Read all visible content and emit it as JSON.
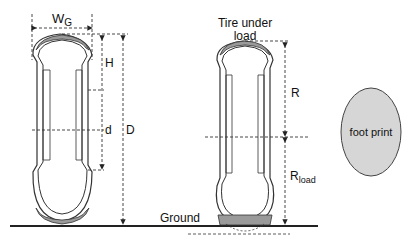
{
  "diagram": {
    "title": "",
    "left_tire": {
      "labels": {
        "width": "W",
        "width_sub": "G",
        "height": "H",
        "rim_diameter": "d",
        "overall_diameter": "D"
      }
    },
    "right_tire": {
      "caption_line1": "Tire under",
      "caption_line2": "load",
      "labels": {
        "radius": "R",
        "loaded_radius": "R",
        "loaded_radius_sub": "load"
      }
    },
    "ground_label": "Ground",
    "footprint_label": "foot print",
    "colors": {
      "line": "#222222",
      "tread": "#9a9a9a",
      "footprint_fill": "#d6d6d6",
      "background": "#ffffff"
    }
  }
}
